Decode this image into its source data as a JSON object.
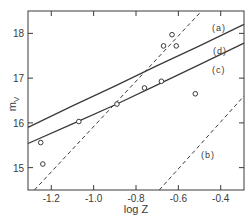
{
  "chart_data": {
    "type": "scatter",
    "title": "",
    "xlabel": "log Z",
    "ylabel": "m_V",
    "ylabel_main": "m",
    "ylabel_sub": "V",
    "xlim": [
      -1.31,
      -0.29
    ],
    "ylim": [
      14.5,
      18.5
    ],
    "grid": false,
    "legend_position": "none",
    "x_ticks": [
      -1.2,
      -1.0,
      -0.8,
      -0.6,
      -0.4
    ],
    "x_tick_labels": [
      "-1.2",
      "-1.0",
      "-0.8",
      "-0.6",
      "-0.4"
    ],
    "y_ticks": [
      15,
      16,
      17,
      18
    ],
    "y_tick_labels": [
      "15",
      "16",
      "17",
      "18"
    ],
    "points": {
      "marker": "open-circle",
      "x": [
        -1.25,
        -1.24,
        -1.07,
        -0.89,
        -0.76,
        -0.67,
        -0.63,
        -0.61,
        -0.68,
        -0.52
      ],
      "y": [
        15.56,
        15.08,
        16.03,
        16.42,
        16.78,
        17.72,
        17.97,
        17.72,
        16.93,
        16.65
      ]
    },
    "series": [
      {
        "name": "(a)",
        "label": "(a)",
        "style": "dashed",
        "x": [
          -1.28,
          -0.49
        ],
        "y": [
          14.5,
          18.5
        ]
      },
      {
        "name": "(b)",
        "label": "(b)",
        "style": "dashed",
        "x": [
          -0.69,
          -0.29
        ],
        "y": [
          14.5,
          16.6
        ]
      },
      {
        "name": "(c)",
        "label": "(c)",
        "style": "solid",
        "x": [
          -1.31,
          -1.1,
          -0.9,
          -0.7,
          -0.5,
          -0.29
        ],
        "y": [
          15.54,
          15.98,
          16.4,
          16.85,
          17.3,
          17.78
        ]
      },
      {
        "name": "(d)",
        "label": "(d)",
        "style": "solid",
        "x": [
          -1.31,
          -1.1,
          -0.9,
          -0.7,
          -0.5,
          -0.29
        ],
        "y": [
          15.9,
          16.38,
          16.82,
          17.28,
          17.72,
          18.2
        ]
      }
    ],
    "annotations": [
      "(a)",
      "(b)",
      "(c)",
      "(d)"
    ]
  }
}
